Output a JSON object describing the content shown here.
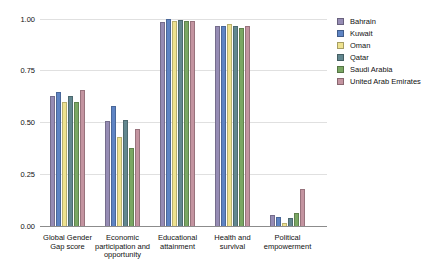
{
  "chart_data": {
    "type": "bar",
    "title": "",
    "xlabel": "",
    "ylabel": "",
    "ylim": [
      0,
      1.0
    ],
    "grid": true,
    "legend_position": "right",
    "yticks": [
      {
        "value": 1.0,
        "label": "1.00"
      },
      {
        "value": 0.75,
        "label": "0.75"
      },
      {
        "value": 0.5,
        "label": "0.50"
      },
      {
        "value": 0.25,
        "label": "0.25"
      },
      {
        "value": 0.0,
        "label": "0.00"
      }
    ],
    "categories": [
      {
        "id": "global-gender-gap-score",
        "lines": [
          "Global Gender",
          "Gap score"
        ]
      },
      {
        "id": "economic-participation-and-opportunity",
        "lines": [
          "Economic",
          "participation and",
          "opportunity"
        ]
      },
      {
        "id": "educational-attainment",
        "lines": [
          "Educational",
          "attainment"
        ]
      },
      {
        "id": "health-and-survival",
        "lines": [
          "Health and",
          "survival"
        ]
      },
      {
        "id": "political-empowerment",
        "lines": [
          "Political",
          "empowerment"
        ]
      }
    ],
    "series": [
      {
        "name": "Bahrain",
        "color": "#968cb4",
        "values": [
          0.63,
          0.505,
          0.985,
          0.965,
          0.055
        ]
      },
      {
        "name": "Kuwait",
        "color": "#5e84c4",
        "values": [
          0.648,
          0.58,
          1.0,
          0.965,
          0.045
        ]
      },
      {
        "name": "Oman",
        "color": "#eee28f",
        "values": [
          0.6,
          0.43,
          0.99,
          0.975,
          0.015
        ]
      },
      {
        "name": "Qatar",
        "color": "#62878f",
        "values": [
          0.63,
          0.51,
          0.995,
          0.965,
          0.04
        ]
      },
      {
        "name": "Saudi Arabia",
        "color": "#7aa763",
        "values": [
          0.598,
          0.375,
          0.99,
          0.958,
          0.065
        ]
      },
      {
        "name": "United Arab Emirates",
        "color": "#c394a0",
        "values": [
          0.655,
          0.467,
          0.99,
          0.968,
          0.178
        ]
      }
    ],
    "colors": {
      "gridline": "#e0e0e0",
      "axis_line": "#8c8c8c",
      "text": "#111111",
      "background": "#ffffff"
    }
  }
}
